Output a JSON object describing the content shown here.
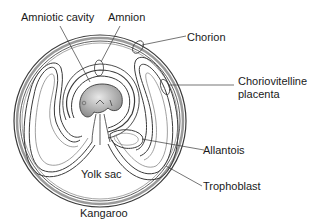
{
  "diagram": {
    "title": "Kangaroo",
    "labels": {
      "amniotic_cavity": "Amniotic cavity",
      "amnion": "Amnion",
      "chorion": "Chorion",
      "choriovitelline_line1": "Choriovitelline",
      "choriovitelline_line2": "placenta",
      "allantois": "Allantois",
      "yolk_sac": "Yolk sac",
      "trophoblast": "Trophoblast"
    },
    "colors": {
      "stroke": "#3a3a3a",
      "membrane_fill": "#c8c8c8",
      "embryo_fill": "#b0b0b0",
      "background": "#ffffff"
    }
  }
}
